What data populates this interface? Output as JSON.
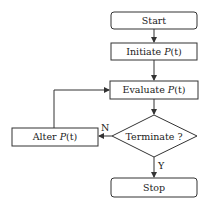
{
  "diagram": {
    "type": "flowchart",
    "nodes": {
      "start": {
        "label": "Start",
        "shape": "rounded-rect"
      },
      "initiate": {
        "label_prefix": "Initiate ",
        "label_func": "P",
        "label_arg": "(t)",
        "shape": "rect"
      },
      "evaluate": {
        "label_prefix": "Evaluate ",
        "label_func": "P",
        "label_arg": "(t)",
        "shape": "rect"
      },
      "terminate": {
        "label": "Terminate ?",
        "shape": "diamond"
      },
      "alter": {
        "label_prefix": "Alter ",
        "label_func": "P",
        "label_arg": "(t)",
        "shape": "rect"
      },
      "stop": {
        "label": "Stop",
        "shape": "rounded-rect"
      }
    },
    "edges": {
      "no_label": "N",
      "yes_label": "Y"
    },
    "colors": {
      "stroke": "#333333",
      "background": "#ffffff",
      "text": "#222222"
    }
  }
}
